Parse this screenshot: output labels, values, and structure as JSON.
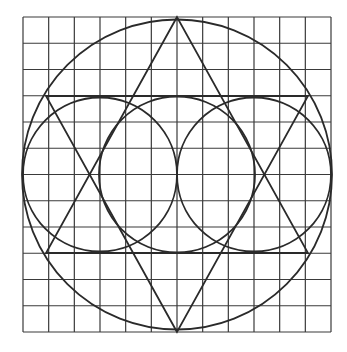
{
  "diagram": {
    "type": "geometric-construction",
    "grid": {
      "cols": 12,
      "rows": 12,
      "x0": 23,
      "y0": 17,
      "x1": 331,
      "y1": 332
    },
    "big_circle": {
      "cx": 177,
      "cy": 174.5,
      "r": 155
    },
    "small_circles": [
      {
        "cx": 100,
        "cy": 174.5,
        "r": 77
      },
      {
        "cx": 177,
        "cy": 174.5,
        "r": 78
      },
      {
        "cx": 254,
        "cy": 174.5,
        "r": 77
      }
    ],
    "triangles": [
      {
        "points": "177,17 46,253 308,253"
      },
      {
        "points": "177,332 46,96 308,96"
      }
    ],
    "stroke_color": "#2a2a2a",
    "grid_color": "#3a3a3a"
  }
}
